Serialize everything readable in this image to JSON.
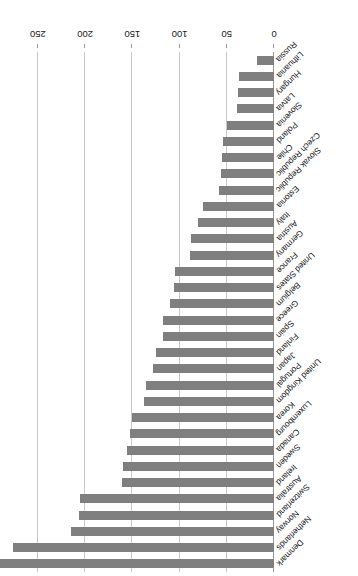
{
  "chart_data": {
    "type": "bar",
    "orientation": "horizontal",
    "title": "",
    "subtitle": "",
    "xlabel": "",
    "ylabel": "",
    "xlim": [
      0,
      290
    ],
    "xticks": [
      0,
      50,
      100,
      150,
      200,
      250
    ],
    "xticklabels": [
      "0",
      "50",
      "100",
      "150",
      "200",
      "250"
    ],
    "grid": "vertical",
    "legend": "none",
    "bar_color": "#7f7f7f",
    "gridline_color": "#c9c9c9",
    "axis_color": "#9a9a9a",
    "rotation_deg": 180,
    "categories": [
      "Denmark",
      "Netherlands",
      "Norway",
      "Switzerland",
      "Australia",
      "Ireland",
      "Sweden",
      "Canada",
      "Luxembourg",
      "Korea",
      "United Kingdom",
      "Portugal",
      "Japan",
      "Finland",
      "Spain",
      "Greece",
      "Belgium",
      "United States",
      "France",
      "Germany",
      "Austria",
      "Italy",
      "Estonia",
      "Slovak Republic",
      "Czech Republic",
      "Chile",
      "Poland",
      "Slovenia",
      "Latvia",
      "Hungary",
      "Lithuania",
      "Russia"
    ],
    "values": [
      290,
      276,
      215,
      206,
      205,
      161,
      160,
      156,
      152,
      150,
      138,
      136,
      128,
      125,
      118,
      117,
      110,
      106,
      105,
      89,
      88,
      80,
      75,
      58,
      56,
      55,
      54,
      50,
      39,
      38,
      37,
      18
    ]
  }
}
